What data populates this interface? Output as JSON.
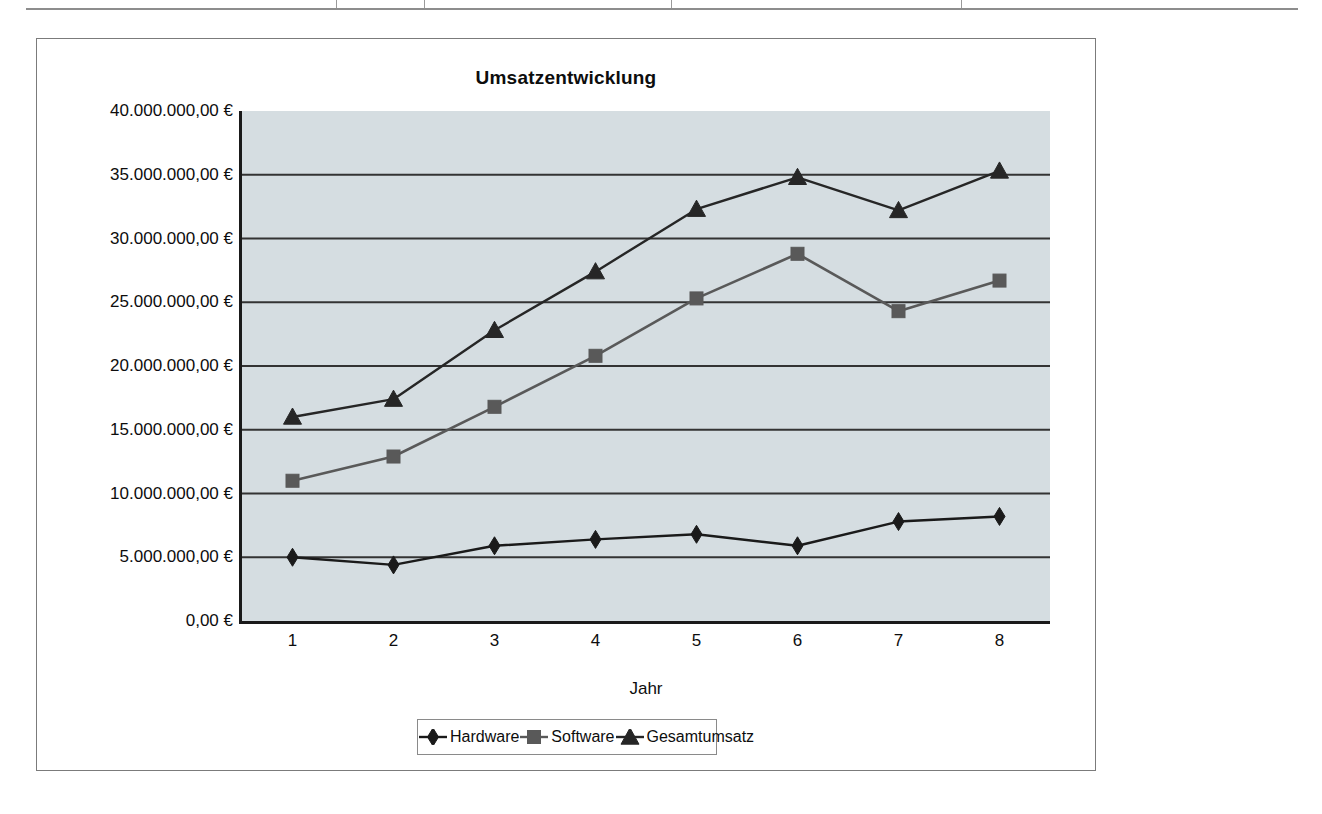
{
  "chart": {
    "title": "Umsatzentwicklung",
    "x_axis_title": "Jahr",
    "y_tick_labels": [
      "0,00 €",
      "5.000.000,00 €",
      "10.000.000,00 €",
      "15.000.000,00 €",
      "20.000.000,00 €",
      "25.000.000,00 €",
      "30.000.000,00 €",
      "35.000.000,00 €",
      "40.000.000,00 €"
    ],
    "x_tick_labels": [
      "1",
      "2",
      "3",
      "4",
      "5",
      "6",
      "7",
      "8"
    ],
    "legend": [
      {
        "label": "Hardware",
        "marker": "diamond-marker-icon",
        "color": "#1a1a1a"
      },
      {
        "label": "Software",
        "marker": "square-marker-icon",
        "color": "#595959"
      },
      {
        "label": "Gesamtumsatz",
        "marker": "triangle-marker-icon",
        "color": "#262626"
      }
    ],
    "plot_background_color": "#d5dde1",
    "axis_color": "#1a1a1a",
    "gridline_color": "#333333"
  },
  "chart_data": {
    "type": "line",
    "title": "Umsatzentwicklung",
    "xlabel": "Jahr",
    "ylabel": "",
    "x": [
      1,
      2,
      3,
      4,
      5,
      6,
      7,
      8
    ],
    "categories": [
      "1",
      "2",
      "3",
      "4",
      "5",
      "6",
      "7",
      "8"
    ],
    "ylim": [
      0,
      40000000
    ],
    "ytick_values": [
      0,
      5000000,
      10000000,
      15000000,
      20000000,
      25000000,
      30000000,
      35000000,
      40000000
    ],
    "grid": true,
    "grid_axis": "y",
    "legend_position": "bottom",
    "currency": "EUR",
    "number_format": "de-DE",
    "series": [
      {
        "name": "Hardware",
        "marker": "diamond",
        "color": "#1a1a1a",
        "values": [
          5000000,
          4400000,
          5900000,
          6400000,
          6800000,
          5900000,
          7800000,
          8200000
        ]
      },
      {
        "name": "Software",
        "marker": "square",
        "color": "#595959",
        "values": [
          11000000,
          12900000,
          16800000,
          20800000,
          25300000,
          28800000,
          24300000,
          26700000
        ]
      },
      {
        "name": "Gesamtumsatz",
        "marker": "triangle",
        "color": "#262626",
        "values": [
          16000000,
          17400000,
          22800000,
          27400000,
          32300000,
          34800000,
          32200000,
          35300000
        ]
      }
    ]
  }
}
